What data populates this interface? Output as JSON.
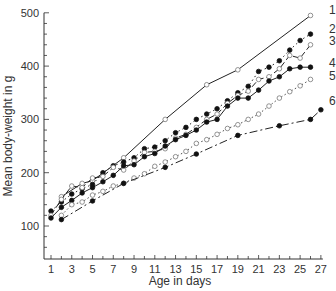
{
  "chart_data": {
    "type": "line",
    "title": "",
    "xlabel": "Age in days",
    "ylabel": "Mean body-weight in g",
    "xlim": [
      0.3,
      27.3
    ],
    "ylim": [
      40,
      500
    ],
    "x_ticks": [
      1,
      3,
      5,
      7,
      9,
      11,
      13,
      15,
      17,
      19,
      21,
      23,
      25,
      27
    ],
    "y_ticks": [
      100,
      200,
      300,
      400,
      500
    ],
    "grid": false,
    "legend_position": "inline-right",
    "series": [
      {
        "name": "1",
        "marker": "open",
        "dash": "",
        "x": [
          2,
          4,
          5,
          8,
          12,
          16,
          19,
          26
        ],
        "y": [
          155,
          180,
          185,
          228,
          300,
          365,
          393,
          495
        ]
      },
      {
        "name": "2",
        "marker": "filled",
        "dash": "1.5,3",
        "x": [
          1,
          2,
          3,
          4,
          5,
          6,
          7,
          8,
          9,
          10,
          11,
          12,
          13,
          14,
          15,
          16,
          17,
          18,
          19,
          20,
          21,
          22,
          23,
          24,
          25,
          26
        ],
        "y": [
          128,
          145,
          160,
          170,
          178,
          200,
          213,
          220,
          228,
          245,
          248,
          260,
          275,
          285,
          300,
          310,
          320,
          335,
          350,
          362,
          390,
          398,
          410,
          430,
          448,
          460
        ]
      },
      {
        "name": "3",
        "marker": "open",
        "dash": "6,3",
        "x": [
          1,
          2,
          3,
          4,
          5,
          6,
          7,
          8,
          9,
          10,
          11,
          12,
          13,
          14,
          15,
          16,
          17,
          18,
          19,
          20,
          21,
          22,
          23,
          24,
          25,
          26
        ],
        "y": [
          120,
          150,
          175,
          172,
          190,
          193,
          210,
          205,
          222,
          238,
          240,
          245,
          265,
          272,
          285,
          300,
          310,
          330,
          345,
          353,
          375,
          380,
          395,
          420,
          415,
          440
        ]
      },
      {
        "name": "4",
        "marker": "filled",
        "dash": "",
        "x": [
          1,
          2,
          3,
          4,
          5,
          6,
          7,
          8,
          9,
          10,
          11,
          12,
          13,
          14,
          15,
          16,
          17,
          18,
          19,
          20,
          21,
          22,
          23,
          24,
          25,
          26
        ],
        "y": [
          115,
          135,
          148,
          162,
          172,
          183,
          195,
          213,
          215,
          230,
          236,
          250,
          262,
          270,
          280,
          295,
          300,
          325,
          340,
          340,
          355,
          372,
          380,
          395,
          398,
          398
        ]
      },
      {
        "name": "5",
        "marker": "open",
        "dash": "1.5,2.5",
        "x": [
          2,
          3,
          4,
          5,
          6,
          7,
          8,
          9,
          10,
          11,
          12,
          13,
          14,
          15,
          16,
          17,
          18,
          19,
          20,
          21,
          22,
          23,
          24,
          25,
          26
        ],
        "y": [
          120,
          140,
          145,
          158,
          165,
          175,
          180,
          190,
          198,
          212,
          220,
          230,
          240,
          255,
          262,
          272,
          283,
          290,
          300,
          310,
          325,
          340,
          352,
          363,
          375
        ]
      },
      {
        "name": "6",
        "marker": "filled",
        "dash": "8,3,2,3",
        "x": [
          2,
          5,
          8,
          12,
          15,
          19,
          23,
          26,
          27
        ],
        "y": [
          112,
          147,
          180,
          210,
          235,
          270,
          288,
          300,
          318
        ]
      }
    ],
    "label_positions": [
      {
        "name": "1",
        "x": 27.2,
        "y": 505
      },
      {
        "name": "2",
        "x": 27.2,
        "y": 470
      },
      {
        "name": "3",
        "x": 27.2,
        "y": 447
      },
      {
        "name": "4",
        "x": 27.2,
        "y": 405
      },
      {
        "name": "5",
        "x": 27.2,
        "y": 381
      },
      {
        "name": "6",
        "x": 27.2,
        "y": 335
      }
    ]
  }
}
